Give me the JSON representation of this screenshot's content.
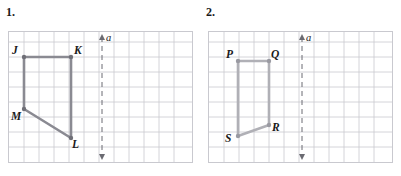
{
  "page": {
    "width": 401,
    "height": 176,
    "background": "#ffffff"
  },
  "style": {
    "grid_line_color": "#c9c9cf",
    "grid_border_color": "#c9c9cf",
    "dashed_axis_color": "#6b6b72",
    "text_color": "#1a1a1a"
  },
  "panels": [
    {
      "id": "panel-1",
      "number_label": "1.",
      "grid": {
        "cell_size": 15,
        "cols": 12,
        "rows": 9,
        "show_grid": true
      },
      "axis": {
        "name": "a",
        "label": "a",
        "orientation": "vertical",
        "style": "dashed-double-arrow",
        "x_cell": 6
      },
      "shape": {
        "name": "quadrilateral-JKLM",
        "stroke_color": "#8a8a92",
        "stroke_width": 2.6,
        "vertex_dot_color": "#6f6f77",
        "vertices": [
          {
            "label": "J",
            "cx": 23,
            "cy": 56,
            "label_dx": -11,
            "label_dy": -12
          },
          {
            "label": "K",
            "cx": 70,
            "cy": 56,
            "label_dx": 4,
            "label_dy": -12
          },
          {
            "label": "L",
            "cx": 70,
            "cy": 137,
            "label_dx": 2,
            "label_dy": 3
          },
          {
            "label": "M",
            "cx": 23,
            "cy": 108,
            "label_dx": -10,
            "label_dy": 3
          }
        ],
        "edges": [
          [
            "J",
            "K"
          ],
          [
            "K",
            "L"
          ],
          [
            "L",
            "M"
          ],
          [
            "M",
            "J"
          ]
        ]
      }
    },
    {
      "id": "panel-2",
      "number_label": "2.",
      "grid": {
        "cell_size": 15,
        "cols": 12,
        "rows": 9,
        "show_grid": true
      },
      "axis": {
        "name": "a",
        "label": "a",
        "orientation": "vertical",
        "style": "dashed-double-arrow",
        "x_cell": 6
      },
      "shape": {
        "name": "quadrilateral-PQRS",
        "stroke_color": "#b0b0b6",
        "stroke_width": 2.6,
        "vertex_dot_color": "#9a9aa2",
        "vertices": [
          {
            "label": "P",
            "cx": 37,
            "cy": 60,
            "label_dx": -11,
            "label_dy": -12
          },
          {
            "label": "Q",
            "cx": 68,
            "cy": 60,
            "label_dx": 4,
            "label_dy": -12
          },
          {
            "label": "R",
            "cx": 68,
            "cy": 124,
            "label_dx": 4,
            "label_dy": 1
          },
          {
            "label": "S",
            "cx": 37,
            "cy": 135,
            "label_dx": -11,
            "label_dy": 1
          }
        ],
        "edges": [
          [
            "P",
            "Q"
          ],
          [
            "Q",
            "R"
          ],
          [
            "R",
            "S"
          ],
          [
            "S",
            "P"
          ]
        ]
      }
    }
  ]
}
